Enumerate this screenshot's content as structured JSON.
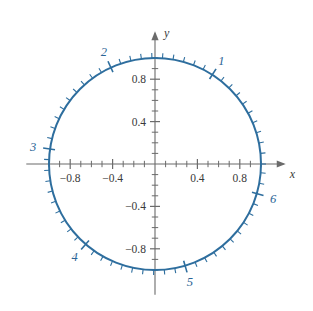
{
  "figure": {
    "colors": {
      "circle": "#2e6e9e",
      "axis": "#6b6b6b",
      "tick_label": "#3a3a3a",
      "radian_label": "#2a6496",
      "background": "#ffffff"
    },
    "axes": {
      "x_name": "x",
      "y_name": "y",
      "x_tick_labels": [
        "-0.8",
        "-0.4",
        "0.4",
        "0.8"
      ],
      "x_tick_values": [
        -0.8,
        -0.4,
        0.4,
        0.8
      ],
      "y_tick_labels": [
        "0.8",
        "0.4",
        "-0.4",
        "-0.8"
      ],
      "y_tick_values": [
        0.8,
        0.4,
        -0.4,
        -0.8
      ],
      "minor_tick_step": 0.1,
      "x_range": [
        -1.12,
        1.12
      ],
      "y_range": [
        -1.12,
        1.12
      ]
    },
    "radian_labels": [
      {
        "text": "1",
        "radians": 1
      },
      {
        "text": "2",
        "radians": 2
      },
      {
        "text": "3",
        "radians": 3
      },
      {
        "text": "4",
        "radians": 4
      },
      {
        "text": "5",
        "radians": 5
      },
      {
        "text": "6",
        "radians": 6
      }
    ]
  },
  "chart_data": {
    "type": "scatter",
    "xlabel": "x",
    "ylabel": "y",
    "xlim": [
      -1.12,
      1.12
    ],
    "ylim": [
      -1.12,
      1.12
    ],
    "grid": false,
    "legend": null,
    "curve": {
      "name": "unit circle",
      "equation": "x^2 + y^2 = 1",
      "radius": 1,
      "center": [
        0,
        0
      ],
      "color": "#2e6e9e"
    },
    "x_tick_labels": [
      "-0.8",
      "-0.4",
      "0.4",
      "0.8"
    ],
    "x_ticks": [
      -0.8,
      -0.4,
      0.4,
      0.8
    ],
    "y_tick_labels": [
      "0.8",
      "0.4",
      "-0.4",
      "-0.8"
    ],
    "y_ticks": [
      0.8,
      0.4,
      -0.4,
      -0.8
    ],
    "axis_minor_tick_step": 0.1,
    "circle_minor_tick_step_radians": 0.1,
    "circle_major_tick_step_radians": 1,
    "annotations": [
      {
        "label": "1",
        "radians": 1,
        "x": 0.5403,
        "y": 0.8415
      },
      {
        "label": "2",
        "radians": 2,
        "x": -0.4161,
        "y": 0.9093
      },
      {
        "label": "3",
        "radians": 3,
        "x": -0.99,
        "y": 0.1411
      },
      {
        "label": "4",
        "radians": 4,
        "x": -0.6536,
        "y": -0.7568
      },
      {
        "label": "5",
        "radians": 5,
        "x": 0.2837,
        "y": -0.9589
      },
      {
        "label": "6",
        "radians": 6,
        "x": 0.9602,
        "y": -0.2794
      }
    ]
  }
}
